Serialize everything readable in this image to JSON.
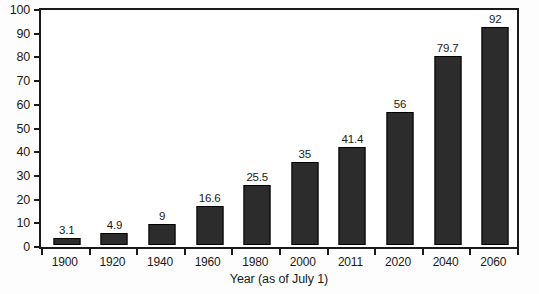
{
  "chart_data": {
    "type": "bar",
    "title": "",
    "subtitle": "",
    "xlabel": "Year (as of July 1)",
    "ylabel": "",
    "categories": [
      "1900",
      "1920",
      "1940",
      "1960",
      "1980",
      "2000",
      "2011",
      "2020",
      "2040",
      "2060"
    ],
    "values": [
      3.1,
      4.9,
      9,
      16.6,
      25.5,
      35,
      41.4,
      56,
      79.7,
      92
    ],
    "data_labels": [
      "3.1",
      "4.9",
      "9",
      "16.6",
      "25.5",
      "35",
      "41.4",
      "56",
      "79.7",
      "92"
    ],
    "ylim": [
      0,
      100
    ],
    "ytick_labels": [
      "100",
      "90",
      "80",
      "70",
      "60",
      "50",
      "40",
      "30",
      "20",
      "10",
      "0"
    ],
    "ytick_values": [
      100,
      90,
      80,
      70,
      60,
      50,
      40,
      30,
      20,
      10,
      0
    ],
    "grid": false,
    "legend": null,
    "legend_position": "none",
    "bar_color": "#2c2c2c",
    "axis_color": "#1a1a1a",
    "background_color": "#ffffff"
  }
}
